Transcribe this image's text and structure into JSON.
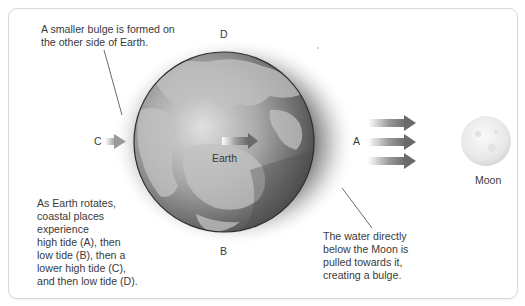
{
  "diagram": {
    "type": "tides-earth-moon",
    "annotations": {
      "top_left": "A smaller bulge is formed on\nthe other side of Earth.",
      "top_left_line1": "A smaller bulge is formed on",
      "top_left_line2": "the other side of Earth.",
      "bottom_left_lines": [
        "As Earth rotates,",
        "coastal places",
        "experience",
        "high tide (A), then",
        "low tide (B), then a",
        "lower high tide (C),",
        "and then low tide (D)."
      ],
      "bottom_right_lines": [
        "The water directly",
        "below the Moon is",
        "pulled towards it,",
        "creating a bulge."
      ]
    },
    "point_labels": {
      "a": "A",
      "b": "B",
      "c": "C",
      "d": "D"
    },
    "bodies": {
      "earth": "Earth",
      "moon": "Moon"
    },
    "arrows": {
      "gravity_arrow_count": 3,
      "direction": "toward Moon"
    },
    "colors": {
      "card_border": "#d9d9d9",
      "text": "#3a3a3a",
      "arrow": "#6e6e6e",
      "earth_ocean": "#8a8a8a",
      "earth_land": "#b8b8b8",
      "moon": "#ececec"
    }
  }
}
